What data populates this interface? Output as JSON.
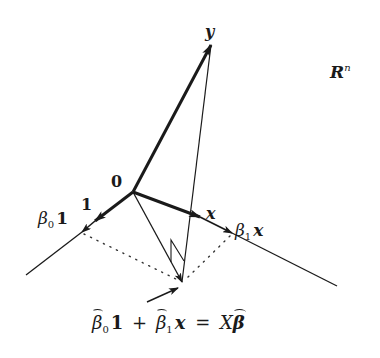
{
  "diagram": {
    "space_label": {
      "main": "R",
      "superscript": "n"
    },
    "origin_label": "0",
    "vectors": {
      "y": {
        "label": "y"
      },
      "one": {
        "label": "1"
      },
      "x": {
        "label": "x"
      },
      "beta0_one": {
        "coef": "β",
        "sub": "0",
        "vec": "1"
      },
      "beta1_x": {
        "coef": "β",
        "sub": "1",
        "vec": "x"
      }
    },
    "fitted_label": {
      "part1_coef": "β",
      "part1_sub": "0",
      "part1_vec": "1",
      "plus": "+",
      "part2_coef": "β",
      "part2_sub": "1",
      "part2_vec": "x",
      "equals": "=",
      "rhs_matrix": "X",
      "rhs_vec": "β"
    },
    "colors": {
      "ink": "#1a1a1a",
      "dotted": "#333333",
      "background": "#ffffff"
    },
    "points": {
      "origin": [
        133,
        192
      ],
      "y_tip": [
        211,
        43
      ],
      "one_tip": [
        95,
        221
      ],
      "beta0_tip": [
        82,
        232
      ],
      "x_tip": [
        200,
        217
      ],
      "beta1_tip": [
        232,
        233
      ],
      "projection": [
        182,
        282
      ],
      "left_line_end": [
        26,
        275
      ],
      "right_line_end": [
        337,
        286
      ]
    }
  }
}
